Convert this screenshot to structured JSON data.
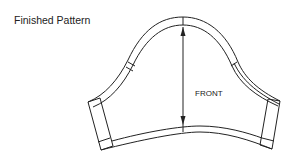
{
  "diagram": {
    "title": "Finished Pattern",
    "piece_label": "FRONT",
    "line_color": "#222222",
    "background": "#ffffff"
  }
}
